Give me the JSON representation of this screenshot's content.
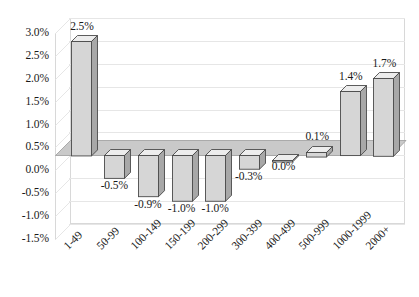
{
  "chart_data": {
    "type": "bar",
    "title": "",
    "subtitle": "",
    "xlabel": "",
    "ylabel": "",
    "categories": [
      "1-49",
      "50-99",
      "100-149",
      "150-199",
      "200-299",
      "300-399",
      "400-499",
      "500-999",
      "1000-1999",
      "2000+"
    ],
    "values": [
      2.5,
      -0.5,
      -0.9,
      -1.0,
      -1.0,
      -0.3,
      0.0,
      0.1,
      1.4,
      1.7
    ],
    "data_labels": [
      "2.5%",
      "-0.5%",
      "-0.9%",
      "-1.0%",
      "-1.0%",
      "-0.3%",
      "0.0%",
      "0.1%",
      "1.4%",
      "1.7%"
    ],
    "ylim": [
      -1.5,
      3.0
    ],
    "ytick_step": 0.5,
    "ytick_labels": [
      "3.0%",
      "2.5%",
      "2.0%",
      "1.5%",
      "1.0%",
      "0.5%",
      "0.0%",
      "-0.5%",
      "-1.0%",
      "-1.5%"
    ],
    "ytick_values": [
      3.0,
      2.5,
      2.0,
      1.5,
      1.0,
      0.5,
      0.0,
      -0.5,
      -1.0,
      -1.5
    ],
    "grid": true,
    "legend": false,
    "legend_position": "none",
    "style": "3d-column",
    "colors": {
      "bar_face": "#d6d6d6",
      "bar_side": "#a8a8a8",
      "bar_top": "#ededed",
      "bar_outline": "#4a4a4a",
      "gridline": "#e6e6e6",
      "plot_border": "#d8d8d8",
      "floor": "#c9c9c9",
      "background": "#ffffff",
      "text": "#1a1a1a"
    }
  }
}
